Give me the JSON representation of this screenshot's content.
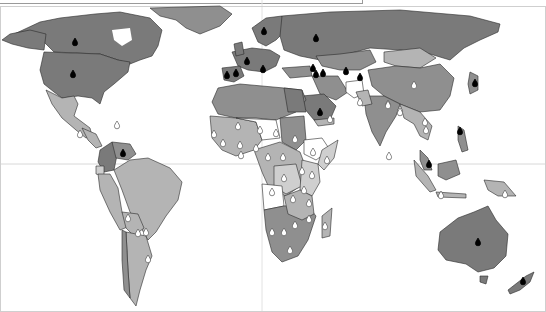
{
  "map": {
    "type": "choropleth-world-map",
    "palette": {
      "ocean": "#ffffff",
      "dark": "#7a7a7a",
      "medium": "#8f8f8f",
      "light": "#b4b4b4",
      "lighter": "#cfcfcf",
      "none": "#ffffff",
      "border": "#2a2a2a",
      "gridline": "#d8d8d8"
    },
    "top_label": "",
    "marker_legend": [
      {
        "name": "black-drop-marker",
        "color": "#000000"
      },
      {
        "name": "white-drop-marker",
        "color": "#ffffff"
      }
    ],
    "black_markers": [
      {
        "region": "Canada",
        "x": 75,
        "y": 42
      },
      {
        "region": "United States",
        "x": 73,
        "y": 74
      },
      {
        "region": "Sweden",
        "x": 264,
        "y": 31
      },
      {
        "region": "Russia",
        "x": 316,
        "y": 38
      },
      {
        "region": "France",
        "x": 247,
        "y": 61
      },
      {
        "region": "Portugal",
        "x": 227,
        "y": 75
      },
      {
        "region": "Spain",
        "x": 236,
        "y": 73
      },
      {
        "region": "Italy",
        "x": 263,
        "y": 69
      },
      {
        "region": "Georgia",
        "x": 313,
        "y": 68
      },
      {
        "region": "Armenia",
        "x": 316,
        "y": 74
      },
      {
        "region": "Azerbaijan",
        "x": 323,
        "y": 73
      },
      {
        "region": "Uzbekistan",
        "x": 346,
        "y": 71
      },
      {
        "region": "Tajikistan",
        "x": 360,
        "y": 77
      },
      {
        "region": "Saudi Arabia",
        "x": 320,
        "y": 112
      },
      {
        "region": "Japan",
        "x": 475,
        "y": 83
      },
      {
        "region": "Venezuela",
        "x": 123,
        "y": 153
      },
      {
        "region": "Philippines",
        "x": 460,
        "y": 131
      },
      {
        "region": "Malaysia",
        "x": 429,
        "y": 164
      },
      {
        "region": "Australia",
        "x": 478,
        "y": 242
      },
      {
        "region": "New Zealand",
        "x": 523,
        "y": 281
      }
    ],
    "white_markers": [
      {
        "region": "China",
        "x": 414,
        "y": 85
      },
      {
        "region": "Nepal",
        "x": 388,
        "y": 104
      },
      {
        "region": "Bangladesh",
        "x": 400,
        "y": 110
      },
      {
        "region": "Myanmar",
        "x": 400,
        "y": 112
      },
      {
        "region": "Thailand",
        "x": 426,
        "y": 130
      },
      {
        "region": "Laos",
        "x": 425,
        "y": 122
      },
      {
        "region": "Sri Lanka",
        "x": 389,
        "y": 156
      },
      {
        "region": "Indonesia",
        "x": 441,
        "y": 195
      },
      {
        "region": "Papua New Guinea",
        "x": 505,
        "y": 194
      },
      {
        "region": "Afghanistan",
        "x": 360,
        "y": 102
      },
      {
        "region": "Pakistan",
        "x": 388,
        "y": 105
      },
      {
        "region": "Yemen",
        "x": 330,
        "y": 119
      },
      {
        "region": "Mali",
        "x": 238,
        "y": 126
      },
      {
        "region": "Niger",
        "x": 260,
        "y": 130
      },
      {
        "region": "Chad",
        "x": 276,
        "y": 133
      },
      {
        "region": "Sudan",
        "x": 295,
        "y": 139
      },
      {
        "region": "Ethiopia",
        "x": 313,
        "y": 152
      },
      {
        "region": "Somalia",
        "x": 327,
        "y": 160
      },
      {
        "region": "Senegal",
        "x": 214,
        "y": 134
      },
      {
        "region": "Guinea",
        "x": 223,
        "y": 143
      },
      {
        "region": "Burkina Faso",
        "x": 240,
        "y": 145
      },
      {
        "region": "Nigeria",
        "x": 256,
        "y": 148
      },
      {
        "region": "Ghana",
        "x": 241,
        "y": 155
      },
      {
        "region": "Central African Republic",
        "x": 283,
        "y": 157
      },
      {
        "region": "Cameroon",
        "x": 268,
        "y": 157
      },
      {
        "region": "DR Congo",
        "x": 284,
        "y": 178
      },
      {
        "region": "Uganda",
        "x": 302,
        "y": 171
      },
      {
        "region": "Kenya",
        "x": 312,
        "y": 175
      },
      {
        "region": "Tanzania",
        "x": 304,
        "y": 190
      },
      {
        "region": "Angola",
        "x": 272,
        "y": 192
      },
      {
        "region": "Zambia",
        "x": 293,
        "y": 199
      },
      {
        "region": "Malawi",
        "x": 309,
        "y": 203
      },
      {
        "region": "Mozambique",
        "x": 309,
        "y": 219
      },
      {
        "region": "Zimbabwe",
        "x": 295,
        "y": 225
      },
      {
        "region": "Botswana",
        "x": 284,
        "y": 232
      },
      {
        "region": "Namibia",
        "x": 272,
        "y": 232
      },
      {
        "region": "South Africa",
        "x": 290,
        "y": 250
      },
      {
        "region": "Madagascar",
        "x": 325,
        "y": 226
      },
      {
        "region": "Peru",
        "x": 128,
        "y": 218
      },
      {
        "region": "Bolivia",
        "x": 138,
        "y": 233
      },
      {
        "region": "Paraguay",
        "x": 146,
        "y": 232
      },
      {
        "region": "Uruguay",
        "x": 148,
        "y": 259
      },
      {
        "region": "Honduras",
        "x": 80,
        "y": 134
      },
      {
        "region": "Haiti",
        "x": 117,
        "y": 125
      }
    ]
  }
}
